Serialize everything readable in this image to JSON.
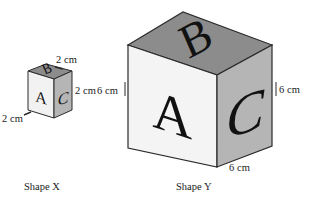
{
  "figure": {
    "background_color": "#ffffff",
    "shapes": [
      {
        "id": "shape-x",
        "caption": "Shape X",
        "edge_length": "2 cm",
        "faces": [
          {
            "letter": "A",
            "position": "front-left",
            "fill": "#f2f2f2"
          },
          {
            "letter": "B",
            "position": "top",
            "fill": "#8c8c8c"
          },
          {
            "letter": "C",
            "position": "right",
            "fill": "#b5b5b5"
          }
        ],
        "dimension_labels": [
          {
            "id": "x-top",
            "text": "2 cm",
            "edge": "top-back-right"
          },
          {
            "id": "x-right",
            "text": "2 cm",
            "edge": "right-vertical"
          },
          {
            "id": "x-front",
            "text": "2 cm",
            "edge": "front-bottom-left"
          }
        ]
      },
      {
        "id": "shape-y",
        "caption": "Shape Y",
        "edge_length": "6 cm",
        "faces": [
          {
            "letter": "A",
            "position": "front-left",
            "fill": "#f2f2f2"
          },
          {
            "letter": "B",
            "position": "top",
            "fill": "#8c8c8c"
          },
          {
            "letter": "C",
            "position": "right",
            "fill": "#b5b5b5"
          }
        ],
        "dimension_labels": [
          {
            "id": "y-left",
            "text": "6 cm",
            "edge": "left-vertical"
          },
          {
            "id": "y-right",
            "text": "6 cm",
            "edge": "right-vertical"
          },
          {
            "id": "y-front",
            "text": "6 cm",
            "edge": "front-bottom-right"
          }
        ]
      }
    ],
    "colors": {
      "outline": "#2b2b2b",
      "face_front": "#f2f2f2",
      "face_top": "#8c8c8c",
      "face_right": "#b5b5b5",
      "letter": "#111111",
      "text": "#1a1a1a"
    }
  }
}
